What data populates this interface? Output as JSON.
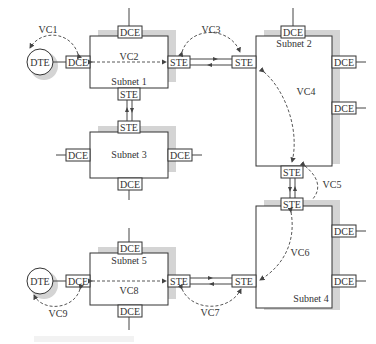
{
  "diagram": {
    "subnets": [
      {
        "id": "subnet1",
        "label": "Subnet 1"
      },
      {
        "id": "subnet2",
        "label": "Subnet 2"
      },
      {
        "id": "subnet3",
        "label": "Subnet 3"
      },
      {
        "id": "subnet4",
        "label": "Subnet 4"
      },
      {
        "id": "subnet5",
        "label": "Subnet 5"
      }
    ],
    "dte": {
      "top": "DTE",
      "bottom": "DTE"
    },
    "labels": {
      "dce": "DCE",
      "ste": "STE"
    },
    "virtual_circuits": {
      "vc1": "VC1",
      "vc2": "VC2",
      "vc3": "VC3",
      "vc4": "VC4",
      "vc5": "VC5",
      "vc6": "VC6",
      "vc7": "VC7",
      "vc8": "VC8",
      "vc9": "VC9"
    },
    "colors": {
      "line": "#444444",
      "shadow": "#d4d4d4",
      "background": "#ffffff"
    }
  }
}
